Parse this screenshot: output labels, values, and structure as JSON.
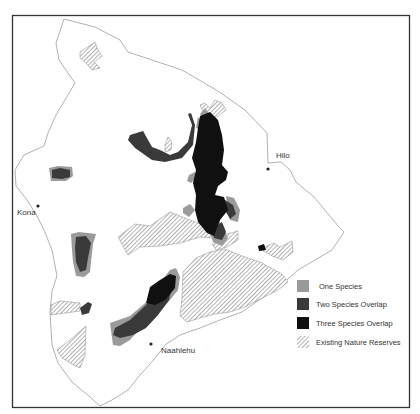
{
  "map": {
    "region": "Island of Hawai'i",
    "cities": [
      {
        "name": "Hilo",
        "x": 268,
        "y": 169,
        "lx": 276,
        "ly": 158
      },
      {
        "name": "Kona",
        "x": 38,
        "y": 206,
        "lx": 17,
        "ly": 215
      },
      {
        "name": "Naahlehu",
        "x": 151,
        "y": 344,
        "lx": 161,
        "ly": 353
      }
    ]
  },
  "legend": {
    "items": [
      {
        "label": "One Species",
        "color": "#9a9a9a",
        "pattern": "solid"
      },
      {
        "label": "Two Species Overlap",
        "color": "#3a3a3a",
        "pattern": "solid"
      },
      {
        "label": "Three Species Overlap",
        "color": "#101010",
        "pattern": "solid"
      },
      {
        "label": "Existing Nature Reserves",
        "color": "#777777",
        "pattern": "hatch"
      }
    ]
  },
  "colors": {
    "frame": "#333333",
    "coast": "#aaaaaa",
    "one": "#9a9a9a",
    "two": "#3a3a3a",
    "three": "#101010",
    "hatch": "#777777"
  }
}
